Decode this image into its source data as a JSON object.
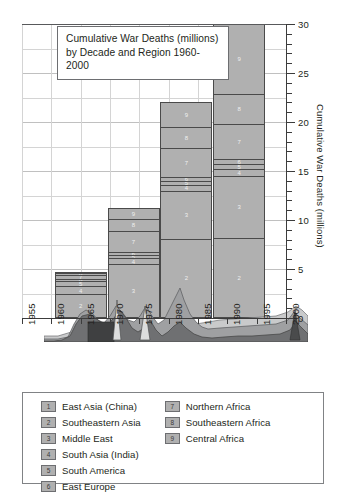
{
  "chart_data": {
    "type": "bar",
    "title": "Cumulative War Deaths (millions) by Decade and Region 1960-2000",
    "title_line1": "Cumulative War Deaths (millions)",
    "title_line2": "by Decade and Region 1960-2000",
    "xlabel": "",
    "ylabel": "Cumulative War Deaths (millions)",
    "ylim": [
      0,
      30
    ],
    "xlim": [
      1955,
      2000
    ],
    "ytick_labels": [
      "0",
      "5",
      "10",
      "15",
      "20",
      "25",
      "30"
    ],
    "ytick_values": [
      0,
      5,
      10,
      15,
      20,
      25,
      30
    ],
    "xtick_labels": [
      "1955",
      "1960",
      "1965",
      "1970",
      "1975",
      "1980",
      "1985",
      "1990",
      "1995",
      "2000"
    ],
    "xtick_values": [
      1955,
      1960,
      1965,
      1970,
      1975,
      1980,
      1985,
      1990,
      1995,
      2000
    ],
    "grid": true,
    "legend_position": "below-plot",
    "series": [
      {
        "name": "East Asia (China)",
        "key": "1",
        "values": [
          0.0,
          0.0,
          0.0,
          0.0
        ]
      },
      {
        "name": "Southeastern Asia",
        "key": "2",
        "values": [
          2.4,
          5.5,
          8.1,
          8.2
        ]
      },
      {
        "name": "Middle East",
        "key": "3",
        "values": [
          0.0,
          2.8,
          4.9,
          6.3
        ]
      },
      {
        "name": "South Asia (India)",
        "key": "4",
        "values": [
          0.9,
          0.6,
          0.6,
          0.7
        ]
      },
      {
        "name": "South America",
        "key": "5",
        "values": [
          0.5,
          0.3,
          0.4,
          0.5
        ]
      },
      {
        "name": "East Europe",
        "key": "6",
        "values": [
          0.2,
          0.3,
          0.4,
          0.5
        ]
      },
      {
        "name": "Northern Africa",
        "key": "7",
        "values": [
          0.4,
          2.2,
          2.9,
          3.6
        ]
      },
      {
        "name": "Southeastern Africa",
        "key": "8",
        "values": [
          0.2,
          1.2,
          2.2,
          3.1
        ]
      },
      {
        "name": "Central Africa",
        "key": "9",
        "values": [
          0.1,
          1.1,
          2.5,
          7.1
        ]
      }
    ],
    "bars": [
      {
        "decade": "1960s",
        "x_center": 1965,
        "total": 4.7,
        "segments": [
          {
            "key": "2",
            "value": 2.4
          },
          {
            "key": "4",
            "value": 0.9
          },
          {
            "key": "5",
            "value": 0.5
          },
          {
            "key": "6",
            "value": 0.2
          },
          {
            "key": "7",
            "value": 0.4
          },
          {
            "key": "8",
            "value": 0.2
          },
          {
            "key": "9",
            "value": 0.1
          }
        ]
      },
      {
        "decade": "1970s",
        "x_center": 1974,
        "total": 12.0,
        "segments": [
          {
            "key": "3",
            "value": 5.5
          },
          {
            "key": "4",
            "value": 0.6
          },
          {
            "key": "5",
            "value": 0.3
          },
          {
            "key": "6",
            "value": 0.3
          },
          {
            "key": "7",
            "value": 2.2
          },
          {
            "key": "8",
            "value": 1.2
          },
          {
            "key": "9",
            "value": 1.1
          }
        ]
      },
      {
        "decade": "1980s",
        "x_center": 1983,
        "total": 22.0,
        "segments": [
          {
            "key": "2",
            "value": 8.1
          },
          {
            "key": "3",
            "value": 4.9
          },
          {
            "key": "4",
            "value": 0.6
          },
          {
            "key": "5",
            "value": 0.4
          },
          {
            "key": "6",
            "value": 0.4
          },
          {
            "key": "7",
            "value": 2.9
          },
          {
            "key": "8",
            "value": 2.2
          },
          {
            "key": "9",
            "value": 2.5
          }
        ]
      },
      {
        "decade": "1990s",
        "x_center": 1992,
        "total": 30.0,
        "segments": [
          {
            "key": "2",
            "value": 8.2
          },
          {
            "key": "3",
            "value": 6.3
          },
          {
            "key": "4",
            "value": 0.7
          },
          {
            "key": "5",
            "value": 0.5
          },
          {
            "key": "6",
            "value": 0.5
          },
          {
            "key": "7",
            "value": 3.6
          },
          {
            "key": "8",
            "value": 3.1
          },
          {
            "key": "9",
            "value": 7.1
          }
        ]
      }
    ],
    "annotation": "Shaded stacked-area stream along the baseline shows the annual (non-cumulative) war deaths by region."
  },
  "legend": {
    "column_left": [
      {
        "key": "1",
        "label": "East Asia (China)"
      },
      {
        "key": "2",
        "label": "Southeastern Asia"
      },
      {
        "key": "3",
        "label": "Middle East"
      },
      {
        "key": "4",
        "label": "South Asia (India)"
      },
      {
        "key": "5",
        "label": "South America"
      },
      {
        "key": "6",
        "label": "East Europe"
      }
    ],
    "column_right": [
      {
        "key": "7",
        "label": "Northern Africa"
      },
      {
        "key": "8",
        "label": "Southeastern Africa"
      },
      {
        "key": "9",
        "label": "Central Africa"
      }
    ]
  },
  "colors": {
    "bar_fill": "#b0b0b0",
    "bar_edge": "#4a4a4a",
    "grid": "#d4d4d4",
    "axis": "#3c3c3c",
    "text": "#231f20",
    "stream_dark": "#6f7072",
    "stream_mid": "#8d8e90",
    "stream_light": "#c9cacb"
  }
}
